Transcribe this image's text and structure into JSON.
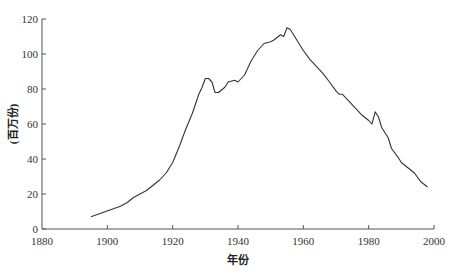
{
  "chart_data": {
    "type": "line",
    "title": "",
    "xlabel": "年份",
    "ylabel": "(百万份)",
    "xlim": [
      1880,
      2000
    ],
    "ylim": [
      0,
      120
    ],
    "x_ticks": [
      "1880",
      "1900",
      "1920",
      "1940",
      "1960",
      "1980",
      "2000"
    ],
    "y_ticks": [
      "0",
      "20",
      "40",
      "60",
      "80",
      "100",
      "120"
    ],
    "grid": false,
    "legend": null,
    "series": [
      {
        "name": "",
        "color": "#333333",
        "x": [
          1895,
          1898,
          1901,
          1904,
          1906,
          1908,
          1910,
          1912,
          1914,
          1916,
          1918,
          1920,
          1922,
          1924,
          1926,
          1928,
          1929,
          1930,
          1931,
          1932,
          1933,
          1934,
          1936,
          1937,
          1939,
          1940,
          1942,
          1944,
          1946,
          1948,
          1950,
          1951,
          1953,
          1954,
          1955,
          1956,
          1958,
          1960,
          1962,
          1964,
          1966,
          1968,
          1970,
          1971,
          1972,
          1974,
          1976,
          1978,
          1980,
          1981,
          1982,
          1983,
          1984,
          1986,
          1987,
          1989,
          1990,
          1992,
          1994,
          1996,
          1998
        ],
        "values": [
          7,
          9,
          11,
          13,
          15,
          18,
          20,
          22,
          25,
          28,
          32,
          38,
          47,
          57,
          66,
          77,
          81,
          86,
          86,
          84,
          78,
          78,
          81,
          84,
          85,
          84,
          88,
          96,
          102,
          106,
          107,
          108,
          111,
          110,
          115,
          114,
          108,
          102,
          97,
          93,
          89,
          84,
          79,
          77,
          77,
          73,
          69,
          65,
          62,
          60,
          67,
          64,
          58,
          52,
          46,
          41,
          38,
          35,
          32,
          27,
          24
        ]
      }
    ]
  },
  "axes": {
    "xlabel": "年份",
    "ylabel": "(百万份)"
  }
}
